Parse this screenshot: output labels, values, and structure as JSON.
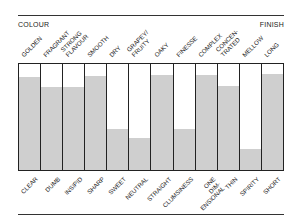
{
  "header": {
    "left_title": "COLOUR",
    "right_title": "FINISH"
  },
  "chart_data": {
    "type": "bar",
    "title": "",
    "xlabel": "",
    "ylabel": "",
    "ylim": [
      0,
      100
    ],
    "grid": false,
    "top_labels": [
      "GOLDEN",
      "FRAGRANT",
      "STRONG FLAVOUR",
      "SMOOTH",
      "DRY",
      "GRAPEY/ FRUITY",
      "OAKY",
      "FINESSE",
      "COMPLEX",
      "CONCEN- TRATED",
      "MELLOW",
      "LONG"
    ],
    "bottom_labels": [
      "CLEAR",
      "DUMB",
      "INSIPID",
      "SHARP",
      "SWEET",
      "NEUTRAL",
      "STRAIGHT",
      "CLUMSINESS",
      "ONE DIM- ENSIONAL",
      "THIN",
      "SPIRITY",
      "SHORT"
    ],
    "categories": [
      "GOLDEN/CLEAR",
      "FRAGRANT/DUMB",
      "STRONG FLAVOUR/INSIPID",
      "SMOOTH/SHARP",
      "DRY/SWEET",
      "GRAPEY FRUITY/NEUTRAL",
      "OAKY/STRAIGHT",
      "FINESSE/CLUMSINESS",
      "COMPLEX/ONE DIMENSIONAL",
      "CONCENTRATED/THIN",
      "MELLOW/SPIRITY",
      "LONG/SHORT"
    ],
    "values": [
      88,
      78,
      78,
      89,
      39,
      30,
      90,
      39,
      90,
      79,
      20,
      91
    ],
    "colors": {
      "fill": "#cfcfcf",
      "background": "#ffffff",
      "border": "#222222"
    }
  }
}
